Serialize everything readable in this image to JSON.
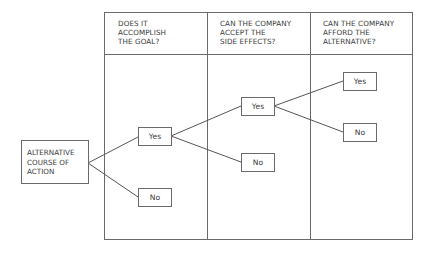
{
  "diagram": {
    "columns": [
      {
        "header": "DOES IT\nACCOMPLISH\nTHE GOAL?"
      },
      {
        "header": "CAN THE COMPANY\nACCEPT THE\nSIDE EFFECTS?"
      },
      {
        "header": "CAN THE COMPANY\nAFFORD THE\nALTERNATIVE?"
      }
    ],
    "root": {
      "label": "ALTERNATIVE\nCOURSE OF\nACTION"
    },
    "nodes": {
      "goal_yes": "Yes",
      "goal_no": "No",
      "side_effects_yes": "Yes",
      "side_effects_no": "No",
      "afford_yes": "Yes",
      "afford_no": "No"
    },
    "edges": [
      {
        "from": "root",
        "to": "goal_yes"
      },
      {
        "from": "root",
        "to": "goal_no"
      },
      {
        "from": "goal_yes",
        "to": "side_effects_yes"
      },
      {
        "from": "goal_yes",
        "to": "side_effects_no"
      },
      {
        "from": "side_effects_yes",
        "to": "afford_yes"
      },
      {
        "from": "side_effects_yes",
        "to": "afford_no"
      }
    ],
    "colors": {
      "line": "#6a6a6a",
      "text": "#3a3a3a",
      "background": "#ffffff"
    }
  }
}
